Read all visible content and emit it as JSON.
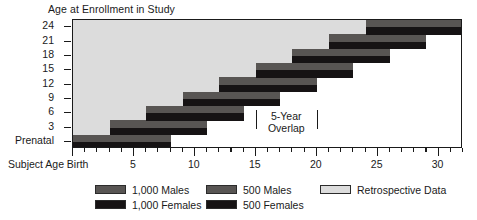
{
  "chart_data": {
    "type": "bar",
    "title": "Age at Enrollment in Study",
    "xlabel": "Subject Age",
    "ylabel": "Age at Enrollment in Study",
    "xlim": [
      0,
      32
    ],
    "ylim_categories": [
      "Prenatal",
      "3",
      "6",
      "9",
      "12",
      "15",
      "18",
      "21",
      "24"
    ],
    "grid": false,
    "legend_position": "bottom",
    "x_tick_labels": [
      {
        "value": 0,
        "label": "Birth"
      },
      {
        "value": 5,
        "label": "5"
      },
      {
        "value": 10,
        "label": "10"
      },
      {
        "value": 15,
        "label": "15"
      },
      {
        "value": 20,
        "label": "20"
      },
      {
        "value": 25,
        "label": "25"
      },
      {
        "value": 30,
        "label": "30"
      }
    ],
    "y_tick_labels": [
      "24",
      "21",
      "18",
      "15",
      "12",
      "9",
      "6",
      "3",
      "Prenatal"
    ],
    "series": [
      {
        "name": "1,000 Males",
        "color": "#585553"
      },
      {
        "name": "1,000 Females",
        "color": "#161314"
      },
      {
        "name": "500 Males",
        "color": "#585553"
      },
      {
        "name": "500 Females",
        "color": "#161314"
      },
      {
        "name": "Retrospective Data",
        "color": "#dcdcdc"
      }
    ],
    "cohorts": [
      {
        "enrollment_age": "Prenatal",
        "x_start": 0,
        "x_end": 8,
        "males": "1,000 Males",
        "females": "1,000 Females",
        "retrospective_start": 0
      },
      {
        "enrollment_age": "3",
        "x_start": 3,
        "x_end": 11,
        "males": "1,000 Males",
        "females": "1,000 Females",
        "retrospective_start": 0
      },
      {
        "enrollment_age": "6",
        "x_start": 6,
        "x_end": 14,
        "males": "1,000 Males",
        "females": "1,000 Females",
        "retrospective_start": 0
      },
      {
        "enrollment_age": "9",
        "x_start": 9,
        "x_end": 17,
        "males": "1,000 Males",
        "females": "1,000 Females",
        "retrospective_start": 0
      },
      {
        "enrollment_age": "12",
        "x_start": 12,
        "x_end": 20,
        "males": "1,000 Males",
        "females": "1,000 Females",
        "retrospective_start": 0
      },
      {
        "enrollment_age": "15",
        "x_start": 15,
        "x_end": 23,
        "males": "500 Males",
        "females": "500 Females",
        "retrospective_start": 0
      },
      {
        "enrollment_age": "18",
        "x_start": 18,
        "x_end": 26,
        "males": "500 Males",
        "females": "500 Females",
        "retrospective_start": 0
      },
      {
        "enrollment_age": "21",
        "x_start": 21,
        "x_end": 29,
        "males": "500 Males",
        "females": "500 Females",
        "retrospective_start": 0
      },
      {
        "enrollment_age": "24",
        "x_start": 24,
        "x_end": 32,
        "males": "500 Males",
        "females": "500 Females",
        "retrospective_start": 0
      }
    ],
    "annotations": [
      {
        "text_line1": "5-Year",
        "text_line2": "Overlap",
        "x_from": 15,
        "x_to": 20,
        "center_x": 17.5
      }
    ]
  },
  "legend": {
    "items": [
      {
        "label": "1,000 Males",
        "color": "#585553",
        "col": 0,
        "row": 0
      },
      {
        "label": "1,000 Females",
        "color": "#161314",
        "col": 0,
        "row": 1
      },
      {
        "label": "500 Males",
        "color": "#585553",
        "col": 1,
        "row": 0
      },
      {
        "label": "500 Females",
        "color": "#161314",
        "col": 1,
        "row": 1
      },
      {
        "label": "Retrospective Data",
        "color": "#dcdcdc",
        "col": 2,
        "row": 0
      }
    ]
  },
  "axis": {
    "y_title": "Age at Enrollment in Study",
    "x_title": "Subject Age"
  },
  "colors": {
    "males": "#585553",
    "females": "#161314",
    "retrospective": "#dcdcdc",
    "axis": "#1a1a1a",
    "background": "#ffffff"
  }
}
